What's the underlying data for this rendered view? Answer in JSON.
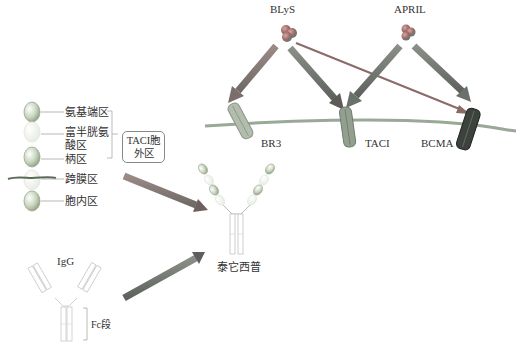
{
  "ligands": {
    "blys": {
      "label": "BLyS"
    },
    "april": {
      "label": "APRIL"
    }
  },
  "receptors": {
    "br3": {
      "label": "BR3"
    },
    "taci": {
      "label": "TACI"
    },
    "bcma": {
      "label": "BCMA"
    }
  },
  "taci_domains": {
    "items": [
      {
        "label": "氨基端区"
      },
      {
        "label_line1": "富半胱氨",
        "label_line2": "酸区"
      },
      {
        "label": "柄区"
      },
      {
        "label": "跨膜区"
      },
      {
        "label": "胞内区"
      }
    ],
    "callout_line1": "TACI胞",
    "callout_line2": "外区"
  },
  "igg": {
    "label": "IgG",
    "fc_label": "Fc段"
  },
  "product": {
    "label": "泰它西普"
  },
  "colors": {
    "arrow_gray": "#7a7a7a",
    "arrow_red": "#8a4a4a",
    "membrane": "#9aa898",
    "br3": "#a8b4a4",
    "taci": "#8f9c8c",
    "bcma": "#3a3f3a",
    "domain_green": "#c4d2b8"
  }
}
